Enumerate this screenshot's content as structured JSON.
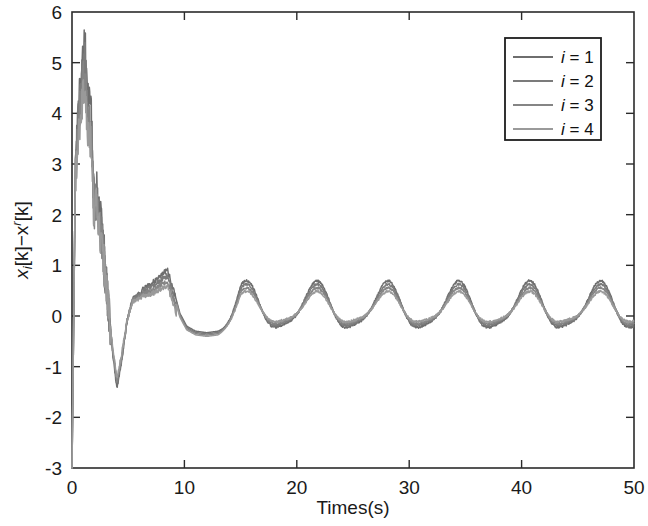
{
  "chart_data": {
    "type": "line",
    "title": "",
    "xlabel": "Times(s)",
    "ylabel": "x_i[k]−x^r[k]",
    "ylabel_parts": {
      "base1": "x",
      "sub1": "i",
      "mid": "[k]−x",
      "sup1": "r",
      "tail": "[k]"
    },
    "xlim": [
      0,
      50
    ],
    "ylim": [
      -3,
      6
    ],
    "xticks": [
      0,
      10,
      20,
      30,
      40,
      50
    ],
    "xticklabels": [
      "0",
      "10",
      "20",
      "30",
      "40",
      "50"
    ],
    "yticks": [
      -3,
      -2,
      -1,
      0,
      1,
      2,
      3,
      4,
      5,
      6
    ],
    "yticklabels": [
      "-3",
      "-2",
      "-1",
      "0",
      "1",
      "2",
      "3",
      "4",
      "5",
      "6"
    ],
    "grid": false,
    "legend_position": "upper-right",
    "legend_entries": [
      {
        "label": "i = 1",
        "color": "#6e6e6e",
        "italic_var": "i",
        "value": "1"
      },
      {
        "label": "i = 2",
        "color": "#7b7b7b",
        "italic_var": "i",
        "value": "2"
      },
      {
        "label": "i = 3",
        "color": "#858585",
        "italic_var": "i",
        "value": "3"
      },
      {
        "label": "i = 4",
        "color": "#9a9a9a",
        "italic_var": "i",
        "value": "4"
      }
    ],
    "series": [
      {
        "name": "i = 1",
        "color": "#6e6e6e",
        "offset": 0.0,
        "peak_value": 5.3,
        "min_value": -1.42,
        "steady_peak": 0.7,
        "steady_trough": -0.38
      },
      {
        "name": "i = 2",
        "color": "#7b7b7b",
        "offset": -0.04,
        "peak_value": 5.05,
        "min_value": -1.3,
        "steady_peak": 0.63,
        "steady_trough": -0.32
      },
      {
        "name": "i = 3",
        "color": "#858585",
        "offset": -0.08,
        "peak_value": 4.8,
        "min_value": -1.18,
        "steady_peak": 0.56,
        "steady_trough": -0.27
      },
      {
        "name": "i = 4",
        "color": "#9a9a9a",
        "offset": -0.12,
        "peak_value": 4.55,
        "min_value": -1.05,
        "steady_peak": 0.49,
        "steady_trough": -0.22
      }
    ],
    "steady_state": {
      "period": 6.3,
      "first_peak_time": 15.4,
      "peak_times": [
        15.4,
        21.7,
        28.0,
        34.3,
        40.6,
        46.9
      ],
      "peak_values": [
        0.66,
        0.67,
        0.66,
        0.68,
        0.67,
        0.7
      ],
      "trough_times": [
        18.5,
        24.8,
        31.1,
        37.4,
        43.7
      ],
      "trough_values": [
        -0.34,
        -0.35,
        -0.33,
        -0.35,
        -0.34
      ]
    },
    "transient_keypoints": {
      "t": [
        0.0,
        0.35,
        0.6,
        0.9,
        1.15,
        1.4,
        1.7,
        1.95,
        2.2,
        2.5,
        2.8,
        3.2,
        3.6,
        4.0,
        4.4,
        4.9,
        5.4,
        5.9,
        6.4,
        7.0,
        7.6,
        8.1,
        8.5,
        9.0,
        9.6,
        10.2,
        11.0,
        12.0,
        13.0
      ],
      "y": [
        -3.0,
        3.2,
        4.2,
        4.9,
        5.3,
        4.3,
        4.0,
        2.3,
        2.6,
        1.9,
        1.3,
        0.3,
        -0.7,
        -1.42,
        -0.9,
        -0.1,
        0.35,
        0.42,
        0.55,
        0.62,
        0.74,
        0.85,
        0.9,
        0.55,
        0.05,
        -0.2,
        -0.3,
        -0.33,
        -0.3
      ]
    }
  },
  "axes": {
    "frame_color": "#2b2b2b",
    "background": "#ffffff"
  }
}
